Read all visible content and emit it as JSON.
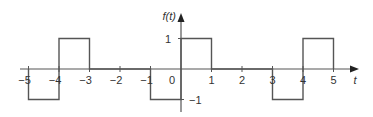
{
  "chart_data": {
    "type": "line",
    "title": "",
    "xlabel": "t",
    "ylabel": "f(t)",
    "xlim": [
      -5.3,
      5.8
    ],
    "ylim": [
      -1.5,
      1.6
    ],
    "x_ticks": [
      -5,
      -4,
      -3,
      -2,
      -1,
      0,
      1,
      2,
      3,
      4,
      5
    ],
    "x_tick_labels": [
      "−5",
      "−4",
      "−3",
      "−2",
      "−1",
      "0",
      "1",
      "2",
      "3",
      "4",
      "5"
    ],
    "y_ticks": [
      1,
      -1
    ],
    "y_tick_labels": [
      "1",
      "−1"
    ],
    "grid": false,
    "legend": null,
    "series": [
      {
        "name": "f(t)",
        "step": true,
        "points": [
          [
            -5,
            0
          ],
          [
            -5,
            -1
          ],
          [
            -4,
            -1
          ],
          [
            -4,
            1
          ],
          [
            -3,
            1
          ],
          [
            -3,
            0
          ],
          [
            -1,
            0
          ],
          [
            -1,
            -1
          ],
          [
            0,
            -1
          ],
          [
            0,
            1
          ],
          [
            1,
            1
          ],
          [
            1,
            0
          ],
          [
            3,
            0
          ],
          [
            3,
            -1
          ],
          [
            4,
            -1
          ],
          [
            4,
            1
          ],
          [
            5,
            1
          ],
          [
            5,
            0
          ]
        ]
      }
    ],
    "segments": [
      {
        "t_start": -5,
        "t_end": -4,
        "value": -1
      },
      {
        "t_start": -4,
        "t_end": -3,
        "value": 1
      },
      {
        "t_start": -3,
        "t_end": -1,
        "value": 0
      },
      {
        "t_start": -1,
        "t_end": 0,
        "value": -1
      },
      {
        "t_start": 0,
        "t_end": 1,
        "value": 1
      },
      {
        "t_start": 1,
        "t_end": 3,
        "value": 0
      },
      {
        "t_start": 3,
        "t_end": 4,
        "value": -1
      },
      {
        "t_start": 4,
        "t_end": 5,
        "value": 1
      }
    ]
  },
  "colors": {
    "line": "#555555",
    "axis": "#555555",
    "text": "#333333"
  }
}
